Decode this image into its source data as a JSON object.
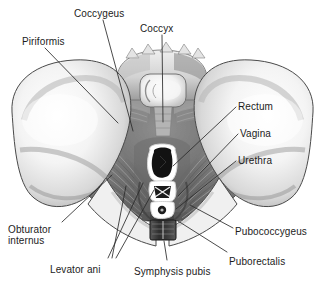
{
  "figure": {
    "view": "superior view of bony pelvis with pelvic diaphragm",
    "style": "grayscale medical illustration",
    "background_color": "#ffffff",
    "label_color": "#1c1c1c",
    "leader_line_color": "#2a2a2a",
    "bone_light": "#f2f2f2",
    "bone_shadow": "#9a9a9a",
    "muscle_mid": "#8d8d8d",
    "muscle_dark": "#4a4a4a",
    "cavity_dark": "#3b3b3b",
    "opening_black": "#121212"
  },
  "labels": [
    {
      "id": "coccygeus",
      "text": "Coccygeus",
      "x": 74,
      "y": 8,
      "align": "left"
    },
    {
      "id": "coccyx",
      "text": "Coccyx",
      "x": 140,
      "y": 23,
      "align": "left"
    },
    {
      "id": "piriformis",
      "text": "Piriformis",
      "x": 22,
      "y": 36,
      "align": "left"
    },
    {
      "id": "rectum",
      "text": "Rectum",
      "x": 238,
      "y": 101,
      "align": "left"
    },
    {
      "id": "vagina",
      "text": "Vagina",
      "x": 240,
      "y": 128,
      "align": "left"
    },
    {
      "id": "urethra",
      "text": "Urethra",
      "x": 238,
      "y": 155,
      "align": "left"
    },
    {
      "id": "pubococcygeus",
      "text": "Pubococcygeus",
      "x": 235,
      "y": 226,
      "align": "left"
    },
    {
      "id": "puborectalis",
      "text": "Puborectalis",
      "x": 229,
      "y": 256,
      "align": "left"
    },
    {
      "id": "symphysis-pubis",
      "text": "Symphysis pubis",
      "x": 134,
      "y": 266,
      "align": "left"
    },
    {
      "id": "levator-ani",
      "text": "Levator ani",
      "x": 50,
      "y": 264,
      "align": "left"
    }
  ],
  "labels_multiline": [
    {
      "id": "obturator-internus",
      "line1": "Obturator",
      "line2": "internus",
      "x": 8,
      "y": 224
    }
  ],
  "structures": [
    {
      "id": "ilium-left",
      "name": "left iliac wing"
    },
    {
      "id": "ilium-right",
      "name": "right iliac wing"
    },
    {
      "id": "sacrum",
      "name": "sacrum"
    },
    {
      "id": "coccyx-bone",
      "name": "coccyx"
    },
    {
      "id": "coccygeus-muscle",
      "name": "coccygeus muscle"
    },
    {
      "id": "piriformis-muscle",
      "name": "piriformis muscle"
    },
    {
      "id": "levator-ani-muscle",
      "name": "levator ani muscle sheet"
    },
    {
      "id": "obturator-internus-muscle",
      "name": "obturator internus muscle"
    },
    {
      "id": "pubococcygeus-muscle",
      "name": "pubococcygeus muscle"
    },
    {
      "id": "puborectalis-muscle",
      "name": "puborectalis muscle sling"
    },
    {
      "id": "rectal-opening",
      "name": "anorectal hiatus"
    },
    {
      "id": "vaginal-opening",
      "name": "vaginal hiatus"
    },
    {
      "id": "urethral-opening",
      "name": "urethral hiatus"
    },
    {
      "id": "symphysis-block",
      "name": "pubic symphysis"
    }
  ]
}
